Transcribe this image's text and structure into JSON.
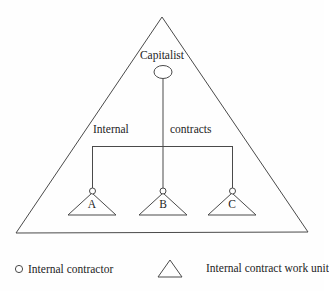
{
  "diagram": {
    "top_node": {
      "label": "Capitalist",
      "shape": "ellipse-icon"
    },
    "relation": {
      "label_left": "Internal",
      "label_right": "contracts",
      "full_label": "Internal contracts"
    },
    "units": [
      {
        "id": "a",
        "label": "A",
        "shape": "triangle-icon",
        "node_shape": "circle-icon"
      },
      {
        "id": "b",
        "label": "B",
        "shape": "triangle-icon",
        "node_shape": "circle-icon"
      },
      {
        "id": "c",
        "label": "C",
        "shape": "triangle-icon",
        "node_shape": "circle-icon"
      }
    ],
    "outer_shape": "large-triangle-icon"
  },
  "legend": {
    "items": [
      {
        "symbol": "circle-icon",
        "label": "Internal contractor"
      },
      {
        "symbol": "triangle-icon",
        "label": "Internal contract work unit"
      }
    ]
  },
  "colors": {
    "background": "#fefefe",
    "line": "#4a4a4a",
    "text": "#242424"
  }
}
